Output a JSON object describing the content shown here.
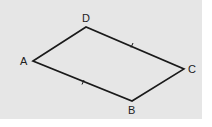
{
  "diagram": {
    "type": "parallelogram",
    "background": "#e6e6e6",
    "stroke": "#1a1a1a",
    "vertices": {
      "A": {
        "label": "A",
        "x": 33,
        "y": 61
      },
      "D": {
        "label": "D",
        "x": 86,
        "y": 27
      },
      "C": {
        "label": "C",
        "x": 184,
        "y": 69
      },
      "B": {
        "label": "B",
        "x": 132,
        "y": 101
      }
    },
    "labels": {
      "A": "A",
      "B": "B",
      "C": "C",
      "D": "D"
    },
    "tick_marks": [
      "DC",
      "AB"
    ]
  }
}
